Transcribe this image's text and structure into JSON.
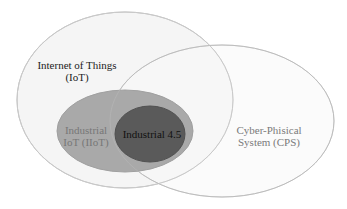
{
  "diagram": {
    "type": "venn",
    "sets": [
      {
        "id": "iot",
        "lines": [
          "Internet of Things",
          "(IoT)"
        ],
        "fill": "#f5f5f5",
        "stroke": "#c4c4c4",
        "text_color": "#222222"
      },
      {
        "id": "cps",
        "lines": [
          "Cyber-Phisical",
          "System (CPS)"
        ],
        "fill": "#f7f7f7",
        "stroke": "#c4c4c4",
        "text_color": "#7a7a7a"
      },
      {
        "id": "iiot",
        "lines": [
          "Industrial",
          "IoT (IIoT)"
        ],
        "fill": "#a9a9a9",
        "stroke": "#a0a0a0",
        "text_color": "#777777"
      },
      {
        "id": "industrial45",
        "lines": [
          "Industrial 4.5"
        ],
        "fill": "#5a5a5a",
        "stroke": "#505050",
        "text_color": "#111111"
      }
    ],
    "relationships": [
      "IIoT is a subset of IoT",
      "Industrial 4.5 is a subset of IIoT",
      "Industrial 4.5 lies within the intersection of IoT and CPS"
    ]
  }
}
